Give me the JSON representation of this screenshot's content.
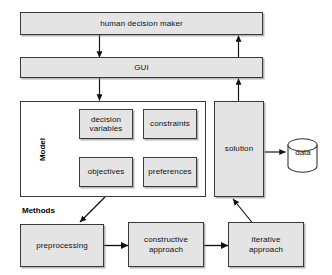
{
  "diagram": {
    "type": "flow-diagram",
    "colors": {
      "node_fill": "#e4e4e4",
      "node_stroke": "#3a3a3a",
      "plain_fill": "#ffffff",
      "background": "#ffffff",
      "text": "#101010",
      "arrow": "#111111"
    },
    "nodes": {
      "human_decision_maker": "human decision maker",
      "gui": "GUI",
      "model_group": "Model",
      "decision_variables": "decision\nvariables",
      "decision_variables_line1": "decision",
      "decision_variables_line2": "variables",
      "constraints": "constraints",
      "objectives": "objectives",
      "preferences": "preferences",
      "solution": "solution",
      "data": "data",
      "methods_group": "Methods",
      "preprocessing": "preprocessing",
      "constructive_approach_line1": "constructive",
      "constructive_approach_line2": "approach",
      "iterative_approach_line1": "iterative",
      "iterative_approach_line2": "approach"
    },
    "edges": [
      {
        "from": "human decision maker",
        "to": "GUI",
        "direction": "down"
      },
      {
        "from": "GUI",
        "to": "Model",
        "direction": "down"
      },
      {
        "from": "solution",
        "to": "GUI",
        "direction": "up"
      },
      {
        "from": "GUI",
        "to": "human decision maker",
        "direction": "up"
      },
      {
        "from": "solution",
        "to": "data",
        "direction": "right"
      },
      {
        "from": "Model",
        "to": "preprocessing",
        "direction": "down-left-diagonal"
      },
      {
        "from": "preprocessing",
        "to": "constructive approach",
        "direction": "right"
      },
      {
        "from": "constructive approach",
        "to": "iterative approach",
        "direction": "right"
      },
      {
        "from": "iterative approach",
        "to": "solution",
        "direction": "up-right-diagonal"
      }
    ]
  }
}
